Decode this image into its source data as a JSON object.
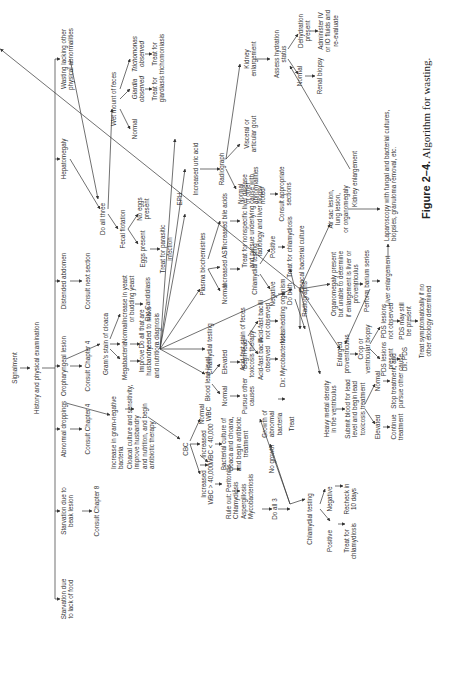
{
  "caption": {
    "label": "Figure 2–4.",
    "text": "Algorithm for wasting."
  },
  "nodes": {
    "signalment": "Signalment",
    "history": "History and physical examination",
    "starv_food": "Starvation due\nto lack of food",
    "starv_beak": "Starvation due to\nbeak lesion",
    "ch8": "Consult Chapter 8",
    "abn_drop": "Abnormal droppings",
    "ch4a": "Consult Chapter 4",
    "oro": "Oropharyngeal lesion",
    "ch4b": "Consult Chapter 4",
    "distended": "Distended abdomen",
    "next_section": "Consult next section",
    "hepato": "Hepatomegaly",
    "wasting_other": "Wasting lacking other\nphysical abnormalities",
    "gram_neg": "Increase in gram-negative\nbacteria",
    "cloacal_sens": "Cloacal culture and sensitivity,\nimprove husbandry\nand nutrition, and begin\nantibiotic therapy",
    "gram_stain": "Gram's stain of cloaca",
    "megabacteria": "Megabacteria",
    "improve": "Improve\nhusbandry\nand nutrition",
    "gram_normal": "Normal",
    "do_all_needed": "Do all that are\nneeded to make\na diagnosis",
    "yeast": "Increase in yeast\nor budding yeast",
    "candidiasis": "Dx: Candidiasis",
    "do_all_three": "Do all three",
    "fecal_flot": "Fecal flotation",
    "eggs": "Eggs present",
    "no_eggs": "No eggs\npresent",
    "treat_parasitic": "Treat for parasitic\ninfection",
    "wet_mount": "Wet mount of feces",
    "wm_normal": "Normal",
    "giardia": "Giardia\nobserved",
    "trichomonas": "Trichomonas\nobserved",
    "treat_giardia": "Treat for\ngiardiasis",
    "treat_tricho": "Treat for\ntrichomoniasis",
    "cbc": "CBC",
    "wbc_gt": "Increased\nWBC > 40,000",
    "wbc_lt": "Increased\nWBC < 40,000",
    "wbc_normal": "Normal\nWBC",
    "rule_out": "Rule out: Peritonitis\nChlamydiosis\nAspergillosis\nMycobacteriosis",
    "bact_culture": "Bacterial culture of\ncloaca and choana,\nand begin antibiotic\ntreatment",
    "do_all_3": "Do all 3",
    "no_growth": "No growth",
    "growth_abn": "Growth of\nabnormal\nbacteria",
    "treat": "Treat",
    "chlam_test_low": "Chlamydial testing",
    "positive_low": "Positive",
    "negative_low": "Negative",
    "treat_chlam_low": "Treat for\nchlamydiosis",
    "recheck": "Recheck in\n10 days",
    "blood_lead": "Blood lead level",
    "bl_normal": "Normal",
    "bl_elevated": "Elevated",
    "pursue_other": "Pursue other\ncauses",
    "begin_lead": "Begin lead\ntoxicosis therapy",
    "acid_fast": "Acid-fast stain of feces",
    "afb_obs": "Acid-fast bacilli\nobserved",
    "afb_not": "Acid-fast bacilli\nnot observed",
    "myco": "Dx: Mycobacteriosis",
    "not_shedding": "Not shedding organism",
    "chlam_test_mid": "Chlamydial testing",
    "plasma_bio": "Plasma biochemistries",
    "pb_normal": "Normal",
    "inc_ast": "Increased AST",
    "inc_bile": "Increased bile acids",
    "eph": "EPH",
    "chlam_test_ast": "Chlamydial testing",
    "negative_ast": "Negative",
    "positive_ast": "Positive",
    "treat_chlam_ast": "Treat for chlamydiosis",
    "do_both": "Do both",
    "cloacal_bact": "Cloacal bacterial culture",
    "treat_liver": "Treat for nonspecific liver disease\nand pursue underlying cause with\nradiology and liver biopsy",
    "inc_uric": "Increased uric acid",
    "radiograph_top": "Radiograph",
    "rad_normal": "Normal\nor other\nabnormalities\nnoted",
    "visceral_gout": "Visceral or\narticular gout",
    "kidney_top": "Kidney\nenlargement",
    "consult_sections": "Consult appropriate\nsections",
    "assess_hydration": "Assess hydration\nstatus",
    "hyd_normal": "Normal",
    "dehydration": "Dehydration\npresent",
    "renal_biopsy": "Renal biopsy",
    "admin_fluids": "Administer IV\nor IO fluids and\nre-evaluate",
    "radiographs": "Radiographs",
    "heavy_metal": "Heavy metal density\nin the ventriculus",
    "submit_blood": "Submit blood for lead\nlevel and begin lead\ntoxicosis treatment",
    "lead_elevated": "Elevated",
    "lead_normal": "Normal",
    "continue_tx": "Continue\ntreatment",
    "stop_tx": "Stop treatment, and\npursue other cause",
    "enlarged_prov": "Enlarged\nproventriculus",
    "crop_biopsy": "Crop or\nventricular biopsy",
    "pds_present": "PDS lesions\npresent",
    "pds_not": "PDS lesions\nnot observed",
    "dx_pds": "Dx: PDS",
    "pds_still": "PDS may still\nbe present",
    "treat_symp": "Treat symptomatically if no\nother etiology determined",
    "organomegaly": "Organomegaly present\nbut unable to determine\nif enlargement is liver or\nproventriculus",
    "barium": "Perform barium series",
    "liver_enl": "Liver enlargement",
    "air_sac": "Air sac lesion,\nlung lesion,\nor organomegaly",
    "laparoscopy": "Laparoscopy with fungal and bacterial cultures,\nbiopsies, granuloma removal, etc.",
    "kidney_bottom": "Kidney enlargement"
  }
}
